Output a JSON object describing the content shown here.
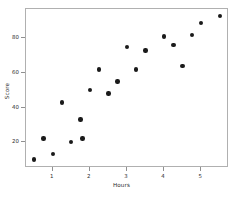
{
  "figure": {
    "background_color": "#ffffff",
    "frame_color": "#b0b0b0",
    "marker_color": "#1a1a1a"
  },
  "caption": {
    "text": "——  ——————  ——"
  },
  "chart_data": {
    "type": "scatter",
    "title": "",
    "xlabel": "Hours",
    "ylabel": "Score",
    "xlim": [
      0.28,
      5.75
    ],
    "ylim": [
      5.0,
      97.0
    ],
    "grid": false,
    "legend": null,
    "xticks": [
      1,
      2,
      3,
      4,
      5
    ],
    "xticklabels": [
      "1",
      "2",
      "3",
      "4",
      "5"
    ],
    "yticks": [
      20,
      40,
      60,
      80
    ],
    "yticklabels": [
      "20",
      "40",
      "60",
      "80"
    ],
    "marker": "circle",
    "series": [
      {
        "name": "observations",
        "points": [
          {
            "x": 0.5,
            "y": 10
          },
          {
            "x": 0.75,
            "y": 22
          },
          {
            "x": 1.0,
            "y": 13
          },
          {
            "x": 1.25,
            "y": 43
          },
          {
            "x": 1.5,
            "y": 20
          },
          {
            "x": 1.75,
            "y": 33
          },
          {
            "x": 1.8,
            "y": 22
          },
          {
            "x": 2.0,
            "y": 50
          },
          {
            "x": 2.25,
            "y": 62
          },
          {
            "x": 2.5,
            "y": 48
          },
          {
            "x": 2.75,
            "y": 55
          },
          {
            "x": 3.0,
            "y": 75
          },
          {
            "x": 3.25,
            "y": 62
          },
          {
            "x": 3.5,
            "y": 73
          },
          {
            "x": 4.0,
            "y": 81
          },
          {
            "x": 4.25,
            "y": 76
          },
          {
            "x": 4.5,
            "y": 64
          },
          {
            "x": 4.75,
            "y": 82
          },
          {
            "x": 5.0,
            "y": 89
          },
          {
            "x": 5.5,
            "y": 93
          }
        ]
      }
    ]
  }
}
